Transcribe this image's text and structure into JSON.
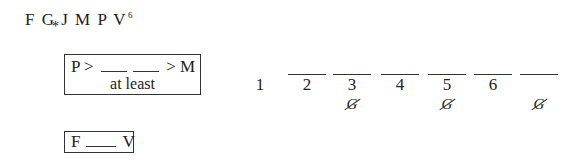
{
  "title": {
    "letters": "F G J M P V",
    "superscript": "6",
    "marker": "*"
  },
  "rule_boxes": [
    {
      "row1": {
        "left": "P >",
        "right": "> M"
      },
      "row2": "at least"
    },
    {
      "row": {
        "left": "F",
        "right": "V"
      }
    }
  ],
  "slots": {
    "numbers": [
      "1",
      "2",
      "3",
      "4",
      "5",
      "6",
      "7"
    ],
    "visible_labels": [
      "1",
      "2",
      "3",
      "4",
      "5",
      "6",
      ""
    ],
    "eliminated": {
      "3": "G",
      "5": "G",
      "7": "G"
    }
  }
}
